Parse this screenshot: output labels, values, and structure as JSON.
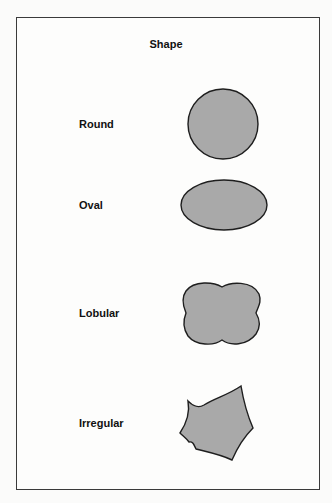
{
  "title": "Shape",
  "rows": [
    {
      "label": "Round",
      "shape": "circle"
    },
    {
      "label": "Oval",
      "shape": "ellipse"
    },
    {
      "label": "Lobular",
      "shape": "lobular"
    },
    {
      "label": "Irregular",
      "shape": "irregular"
    }
  ],
  "colors": {
    "fill": "#a9a9a9",
    "stroke": "#1e1e1e",
    "frame": "#3a3a3a"
  }
}
